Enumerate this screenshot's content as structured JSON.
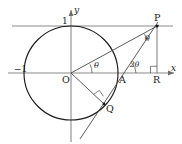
{
  "figure": {
    "type": "geometry-diagram",
    "axes": {
      "x_label": "x",
      "y_label": "y",
      "x_tick_label": "−1",
      "y_tick_label": "1"
    },
    "points": [
      {
        "name": "O",
        "label": "O",
        "x": 71,
        "y": 73
      },
      {
        "name": "A",
        "label": "A",
        "x": 122,
        "y": 73
      },
      {
        "name": "Q",
        "label": "Q",
        "x": 104,
        "y": 104
      },
      {
        "name": "P",
        "label": "P",
        "x": 157,
        "y": 26
      },
      {
        "name": "R",
        "label": "R",
        "x": 157,
        "y": 73
      }
    ],
    "angles": [
      {
        "name": "angle-at-origin",
        "label": "θ",
        "vertex": "O"
      },
      {
        "name": "angle-at-p",
        "label": "θ",
        "vertex": "P"
      },
      {
        "name": "angle-at-a",
        "label": "2θ",
        "vertex": "A"
      }
    ],
    "right_angle_markers": [
      {
        "name": "right-angle-at-q",
        "vertex": "Q"
      },
      {
        "name": "right-angle-at-r",
        "vertex": "R"
      }
    ],
    "colors": {
      "circle": "#1a1a1a",
      "axis": "#8a8a8a",
      "ray": "#4a4a4a",
      "label": "#1a1a1a",
      "background": "#ffffff"
    }
  }
}
